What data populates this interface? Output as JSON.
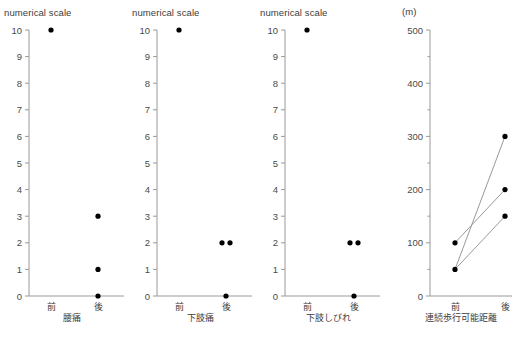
{
  "figure": {
    "width": 517,
    "height": 338,
    "background": "#ffffff",
    "dot_color": "#000000",
    "axis_color": "#9a9a9a",
    "line_color": "#8d8d8d",
    "text_color": "#3c3c3c"
  },
  "panels": [
    {
      "id": "lower-back-pain",
      "axis_title": "numerical scale",
      "caption": "腰痛",
      "categories": [
        "前",
        "後"
      ],
      "y_ticks": [
        "0",
        "1",
        "2",
        "3",
        "4",
        "5",
        "6",
        "7",
        "8",
        "9",
        "10"
      ]
    },
    {
      "id": "leg-pain",
      "axis_title": "numerical scale",
      "caption": "下肢痛",
      "categories": [
        "前",
        "後"
      ],
      "y_ticks": [
        "0",
        "1",
        "2",
        "3",
        "4",
        "5",
        "6",
        "7",
        "8",
        "9",
        "10"
      ]
    },
    {
      "id": "leg-numbness",
      "axis_title": "numerical scale",
      "caption": "下肢しびれ",
      "categories": [
        "前",
        "後"
      ],
      "y_ticks": [
        "0",
        "1",
        "2",
        "3",
        "4",
        "5",
        "6",
        "7",
        "8",
        "9",
        "10"
      ]
    },
    {
      "id": "walking-distance",
      "axis_title": "(m)",
      "caption": "連続歩行可能距離",
      "categories": [
        "前",
        "後"
      ],
      "y_ticks": [
        "0",
        "100",
        "200",
        "300",
        "400",
        "500"
      ]
    }
  ],
  "chart_data": [
    {
      "type": "scatter",
      "title": "腰痛",
      "ylabel": "numerical scale",
      "xlabel": "",
      "categories": [
        "前",
        "後"
      ],
      "ylim": [
        0,
        10
      ],
      "ytick_values": [
        0,
        1,
        2,
        3,
        4,
        5,
        6,
        7,
        8,
        9,
        10
      ],
      "grid": false,
      "legend": "none",
      "points": [
        {
          "x": "前",
          "y": 10,
          "offset": 0
        },
        {
          "x": "後",
          "y": 3,
          "offset": 0
        },
        {
          "x": "後",
          "y": 1,
          "offset": 0
        },
        {
          "x": "後",
          "y": 0,
          "offset": 0
        }
      ],
      "connections": []
    },
    {
      "type": "scatter",
      "title": "下肢痛",
      "ylabel": "numerical scale",
      "xlabel": "",
      "categories": [
        "前",
        "後"
      ],
      "ylim": [
        0,
        10
      ],
      "ytick_values": [
        0,
        1,
        2,
        3,
        4,
        5,
        6,
        7,
        8,
        9,
        10
      ],
      "grid": false,
      "legend": "none",
      "points": [
        {
          "x": "前",
          "y": 10,
          "offset": 0
        },
        {
          "x": "後",
          "y": 2,
          "offset": -4
        },
        {
          "x": "後",
          "y": 2,
          "offset": 4
        },
        {
          "x": "後",
          "y": 0,
          "offset": 0
        }
      ],
      "connections": []
    },
    {
      "type": "scatter",
      "title": "下肢しびれ",
      "ylabel": "numerical scale",
      "xlabel": "",
      "categories": [
        "前",
        "後"
      ],
      "ylim": [
        0,
        10
      ],
      "ytick_values": [
        0,
        1,
        2,
        3,
        4,
        5,
        6,
        7,
        8,
        9,
        10
      ],
      "grid": false,
      "legend": "none",
      "points": [
        {
          "x": "前",
          "y": 10,
          "offset": 0
        },
        {
          "x": "後",
          "y": 2,
          "offset": -4
        },
        {
          "x": "後",
          "y": 2,
          "offset": 4
        },
        {
          "x": "後",
          "y": 0,
          "offset": 0
        }
      ],
      "connections": []
    },
    {
      "type": "line",
      "title": "連続歩行可能距離",
      "ylabel": "(m)",
      "xlabel": "",
      "categories": [
        "前",
        "後"
      ],
      "ylim": [
        0,
        500
      ],
      "ytick_values": [
        0,
        100,
        200,
        300,
        400,
        500
      ],
      "minor_tick_step": 50,
      "grid": false,
      "legend": "none",
      "points": [
        {
          "x": "前",
          "y": 100,
          "offset": 0
        },
        {
          "x": "前",
          "y": 50,
          "offset": 0
        },
        {
          "x": "後",
          "y": 300,
          "offset": 0
        },
        {
          "x": "後",
          "y": 200,
          "offset": 0
        },
        {
          "x": "後",
          "y": 150,
          "offset": 0
        }
      ],
      "connections": [
        {
          "before": 50,
          "after": 300
        },
        {
          "before": 100,
          "after": 200
        },
        {
          "before": 50,
          "after": 150
        }
      ]
    }
  ]
}
